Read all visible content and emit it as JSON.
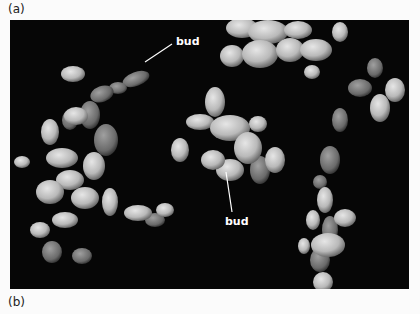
{
  "figure": {
    "panel_labels": [
      "(a)",
      "(b)"
    ],
    "photo": {
      "description": "Scanning electron micrograph of budding yeast cells in chains and clusters on black background",
      "background": "#060606",
      "cell_color": "#c8c8c8"
    },
    "annotations": [
      {
        "text": "bud",
        "label_pos": [
          176,
          39
        ],
        "pointer_from": [
          172,
          44
        ],
        "pointer_to": [
          145,
          62
        ]
      },
      {
        "text": "bud",
        "label_pos": [
          228,
          221
        ],
        "pointer_from": [
          232,
          212
        ],
        "pointer_to": [
          226,
          172
        ]
      }
    ]
  }
}
